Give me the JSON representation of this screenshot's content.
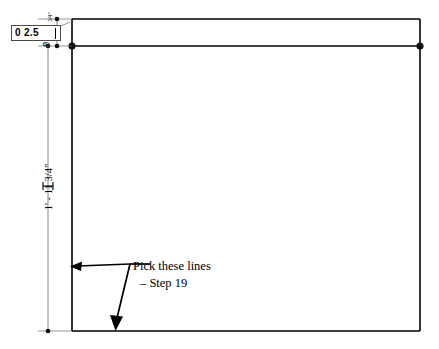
{
  "drawing": {
    "title": "CAD dimension editing view",
    "background_color": "#ffffff",
    "line_color": "#000000",
    "grip_color": "#111111"
  },
  "dimension_edit_box": {
    "name": "dimension-text-edit",
    "value": "0 2.5",
    "placeholder": "0 2.5",
    "border_color": "#4a4a4a",
    "has_caret": true
  },
  "dimensions": {
    "vertical_overall": {
      "label": "1' - 11 3/4\"",
      "orientation": "vertical"
    },
    "top_small": {
      "label": "3/4\"",
      "orientation": "vertical"
    },
    "zero_tick": {
      "label": "0"
    }
  },
  "annotation": {
    "line1": "Pick these lines",
    "line2": "– Step 19"
  },
  "geometry": {
    "outer_rect": {
      "x": 72,
      "y": 19,
      "width": 348,
      "height": 312
    },
    "inner_line_y": 46,
    "grips": [
      {
        "x": 72,
        "y": 46
      },
      {
        "x": 420,
        "y": 46
      },
      {
        "x": 63,
        "y": 19
      },
      {
        "x": 63,
        "y": 46
      },
      {
        "x": 63,
        "y": 331
      }
    ]
  }
}
